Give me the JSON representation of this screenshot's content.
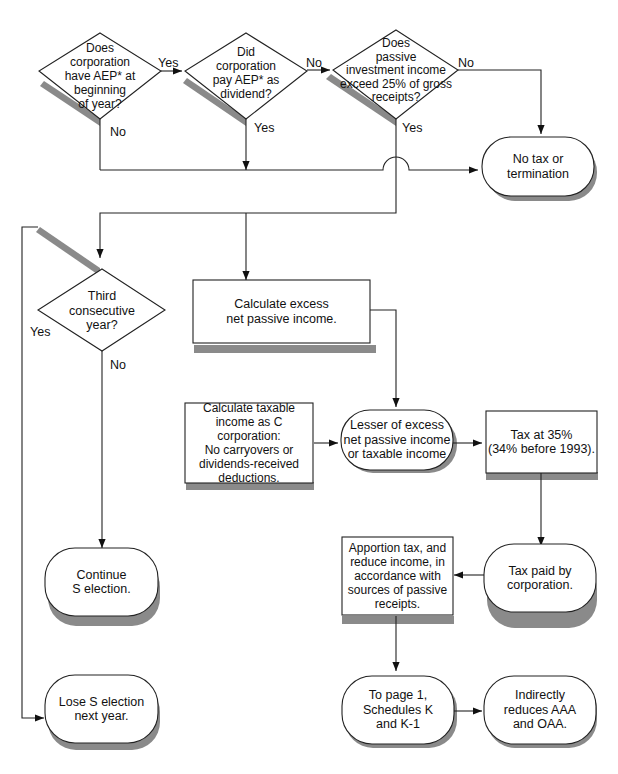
{
  "diagram": {
    "type": "flowchart",
    "colors": {
      "stroke": "#222222",
      "shadow": "#8a8a8a",
      "fill": "#ffffff"
    },
    "nodes": {
      "aep_start": {
        "shape": "diamond",
        "text": "Does\ncorporation\nhave AEP* at\nbeginning\nof year?"
      },
      "aep_paid": {
        "shape": "diamond",
        "text": "Did\ncorporation\npay AEP* as\ndividend?"
      },
      "passive_25": {
        "shape": "diamond",
        "text": "Does\npassive\ninvestment income\nexceed 25% of gross\nreceipts?"
      },
      "no_tax": {
        "shape": "terminal",
        "text": "No tax or\ntermination"
      },
      "third_year": {
        "shape": "diamond",
        "text": "Third\nconsecutive\nyear?"
      },
      "calc_excess": {
        "shape": "process",
        "text": "Calculate excess\nnet passive income."
      },
      "calc_taxable": {
        "shape": "process",
        "text": "Calculate taxable\nincome as C corporation:\nNo carryovers or\ndividends-received\ndeductions."
      },
      "lesser_of": {
        "shape": "terminal",
        "text": "Lesser of excess\nnet passive income\nor taxable income"
      },
      "tax_35": {
        "shape": "process",
        "text": "Tax at 35%\n(34% before 1993)."
      },
      "continue_s": {
        "shape": "terminal",
        "text": "Continue\nS election."
      },
      "tax_paid": {
        "shape": "terminal",
        "text": "Tax paid by\ncorporation."
      },
      "apportion": {
        "shape": "process",
        "text": "Apportion tax, and\nreduce income, in\naccordance with\nsources of passive\nreceipts."
      },
      "lose_s": {
        "shape": "terminal",
        "text": "Lose S election\nnext year."
      },
      "to_page1": {
        "shape": "terminal",
        "text": "To page 1,\nSchedules K\nand K-1"
      },
      "reduces_aaa": {
        "shape": "terminal",
        "text": "Indirectly\nreduces AAA\nand OAA."
      }
    },
    "edge_labels": {
      "aep_start_yes": "Yes",
      "aep_start_no": "No",
      "aep_paid_no": "No",
      "aep_paid_yes": "Yes",
      "passive_no": "No",
      "passive_yes": "Yes",
      "third_yes": "Yes",
      "third_no": "No"
    },
    "edges": [
      {
        "from": "aep_start",
        "to": "aep_paid",
        "label": "Yes"
      },
      {
        "from": "aep_start",
        "to": "no_tax",
        "label": "No"
      },
      {
        "from": "aep_paid",
        "to": "passive_25",
        "label": "No"
      },
      {
        "from": "aep_paid",
        "to": "no_tax",
        "label": "Yes"
      },
      {
        "from": "passive_25",
        "to": "no_tax",
        "label": "No"
      },
      {
        "from": "passive_25",
        "to": "third_year",
        "label": "Yes"
      },
      {
        "from": "passive_25",
        "to": "calc_excess",
        "label": "Yes"
      },
      {
        "from": "third_year",
        "to": "lose_s",
        "label": "Yes"
      },
      {
        "from": "third_year",
        "to": "continue_s",
        "label": "No"
      },
      {
        "from": "calc_excess",
        "to": "lesser_of"
      },
      {
        "from": "calc_taxable",
        "to": "lesser_of"
      },
      {
        "from": "lesser_of",
        "to": "tax_35"
      },
      {
        "from": "tax_35",
        "to": "tax_paid"
      },
      {
        "from": "tax_paid",
        "to": "apportion"
      },
      {
        "from": "apportion",
        "to": "to_page1"
      },
      {
        "from": "to_page1",
        "to": "reduces_aaa"
      }
    ]
  }
}
